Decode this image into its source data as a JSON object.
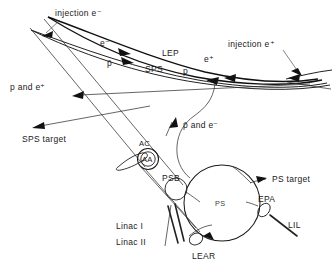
{
  "figure": {
    "background_color": "#ffffff",
    "line_color": "#111111",
    "text_color": "#1a1a1a"
  },
  "labels": {
    "injection_electron": "injection e⁻",
    "injection_positron": "injection e⁺",
    "lep": "LEP",
    "sps": "SPS",
    "electron": "e⁻",
    "positron": "e⁺",
    "antiproton": "p̄",
    "proton": "p",
    "p_and_epositron": "p and e⁺",
    "sps_target": "SPS target",
    "pbar_and_electron": "p̄ and e⁻",
    "ac": "AC",
    "aa": "AA",
    "psb": "PSB",
    "ps": "PS",
    "ps_target": "PS target",
    "epa": "EPA",
    "lil": "LIL",
    "linac_1": "Linac I",
    "linac_2": "Linac II",
    "lear": "LEAR"
  }
}
